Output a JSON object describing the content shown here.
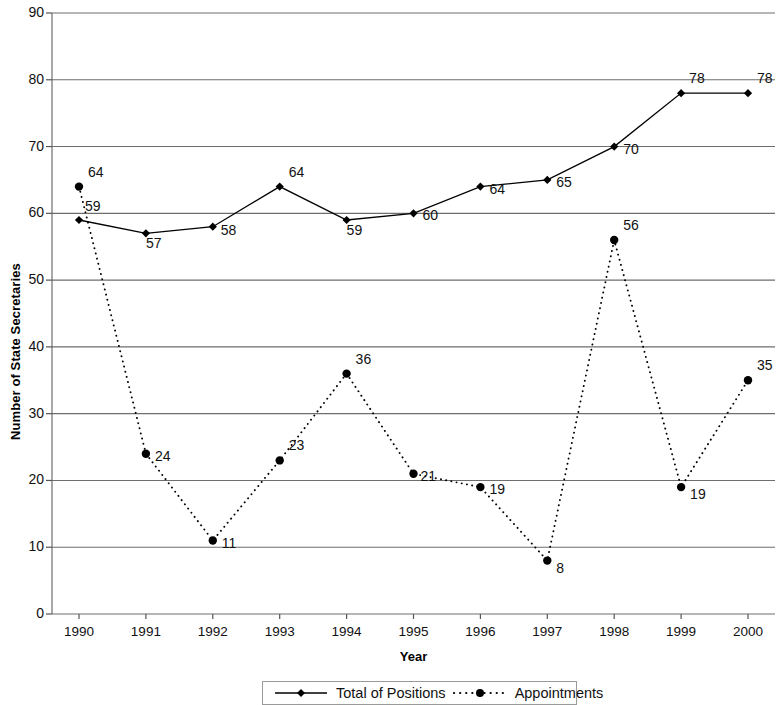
{
  "chart_data": {
    "type": "line",
    "title": "",
    "xlabel": "Year",
    "ylabel": "Number of State Secretaries",
    "categories": [
      "1990",
      "1991",
      "1992",
      "1993",
      "1994",
      "1995",
      "1996",
      "1997",
      "1998",
      "1999",
      "2000"
    ],
    "ylim": [
      0,
      90
    ],
    "yticks": [
      "0",
      "10",
      "20",
      "30",
      "40",
      "50",
      "60",
      "70",
      "80",
      "90"
    ],
    "grid": true,
    "legend_position": "bottom",
    "series": [
      {
        "name": "Total of Positions",
        "marker": "diamond",
        "line": "solid",
        "color": "#000000",
        "values": [
          59,
          57,
          58,
          64,
          59,
          60,
          64,
          65,
          70,
          78,
          78
        ],
        "labels": [
          "59",
          "57",
          "58",
          "64",
          "59",
          "60",
          "64",
          "65",
          "70",
          "78",
          "78"
        ]
      },
      {
        "name": "Appointments",
        "marker": "circle",
        "line": "dotted",
        "color": "#000000",
        "values": [
          64,
          24,
          11,
          23,
          36,
          21,
          19,
          8,
          56,
          19,
          35
        ],
        "labels": [
          "64",
          "24",
          "11",
          "23",
          "36",
          "21",
          "19",
          "8",
          "56",
          "19",
          "35"
        ]
      }
    ]
  },
  "legend": {
    "items": [
      {
        "label": "Total of Positions",
        "marker": "diamond",
        "line": "solid"
      },
      {
        "label": "Appointments",
        "marker": "circle",
        "line": "dotted"
      }
    ]
  }
}
